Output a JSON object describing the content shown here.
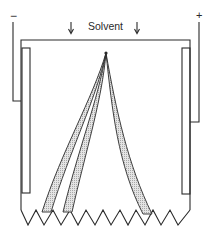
{
  "diagram": {
    "labels": {
      "solvent": "Solvent",
      "cathode": "−",
      "anode": "+"
    },
    "colors": {
      "stroke": "#2a2a2a",
      "stipple": "#c8c8c8",
      "background": "#ffffff"
    },
    "elements": [
      {
        "id": "solvent-inlet-arrow-left",
        "type": "arrow",
        "direction": "down"
      },
      {
        "id": "solvent-inlet-arrow-right",
        "type": "arrow",
        "direction": "down"
      },
      {
        "id": "chamber",
        "type": "container"
      },
      {
        "id": "electrode-left",
        "type": "plate",
        "polarity": "negative"
      },
      {
        "id": "electrode-right",
        "type": "plate",
        "polarity": "positive"
      },
      {
        "id": "application-point",
        "type": "point"
      },
      {
        "id": "band-1",
        "type": "stippled-band",
        "direction": "left"
      },
      {
        "id": "band-2",
        "type": "stippled-band",
        "direction": "left"
      },
      {
        "id": "band-3",
        "type": "stippled-band",
        "direction": "right"
      },
      {
        "id": "serrated-edge",
        "type": "zigzag",
        "teeth": 10
      }
    ]
  }
}
